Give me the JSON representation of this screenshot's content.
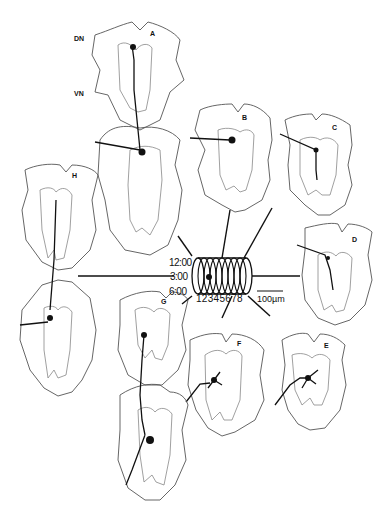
{
  "figure": {
    "side_labels": {
      "dorsal": "DN",
      "ventral": "VN"
    },
    "panels": [
      {
        "id": "A",
        "label": "A"
      },
      {
        "id": "B",
        "label": "B"
      },
      {
        "id": "C",
        "label": "C"
      },
      {
        "id": "D",
        "label": "D"
      },
      {
        "id": "E",
        "label": "E"
      },
      {
        "id": "F",
        "label": "F"
      },
      {
        "id": "G",
        "label": "G"
      },
      {
        "id": "H",
        "label": "H"
      }
    ],
    "cylinder": {
      "clock_positions": [
        "12:00",
        "3:00",
        "6:00"
      ],
      "segment_numbers": "12345678",
      "segments": [
        "1",
        "2",
        "3",
        "4",
        "5",
        "6",
        "7",
        "8"
      ]
    },
    "scale_bar": {
      "label": "100µm"
    }
  }
}
